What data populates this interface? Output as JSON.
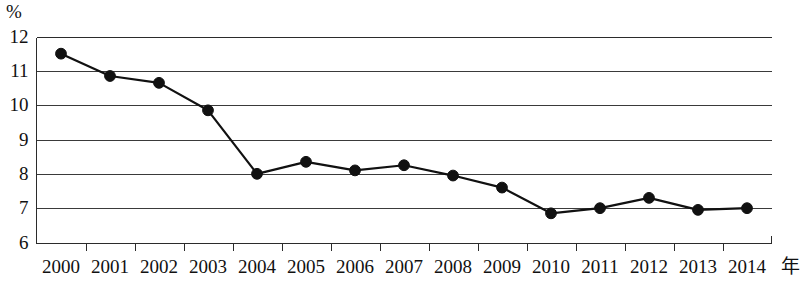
{
  "chart_data": {
    "type": "line",
    "title": "",
    "subtitle": "",
    "xlabel": "年",
    "ylabel": "%",
    "unit_label": "%",
    "categories": [
      "2000",
      "2001",
      "2002",
      "2003",
      "2004",
      "2005",
      "2006",
      "2007",
      "2008",
      "2009",
      "2010",
      "2011",
      "2012",
      "2013",
      "2014"
    ],
    "x": [
      2000,
      2001,
      2002,
      2003,
      2004,
      2005,
      2006,
      2007,
      2008,
      2009,
      2010,
      2011,
      2012,
      2013,
      2014
    ],
    "values": [
      11.5,
      10.85,
      10.65,
      9.85,
      8.0,
      8.35,
      8.1,
      8.25,
      7.95,
      7.6,
      6.85,
      7.0,
      7.3,
      6.95,
      7.0
    ],
    "series": [
      {
        "name": "",
        "values": [
          11.5,
          10.85,
          10.65,
          9.85,
          8.0,
          8.35,
          8.1,
          8.25,
          7.95,
          7.6,
          6.85,
          7.0,
          7.3,
          6.95,
          7.0
        ]
      }
    ],
    "ylim": [
      6,
      12
    ],
    "yticks": [
      "12",
      "11",
      "10",
      "9",
      "8",
      "7",
      "6"
    ],
    "ytick_values": [
      12,
      11,
      10,
      9,
      8,
      7,
      6
    ],
    "xtick_labels": [
      "2000",
      "2001",
      "2002",
      "2003",
      "2004",
      "2005",
      "2006",
      "2007",
      "2008",
      "2009",
      "2010",
      "2011",
      "2012",
      "2013",
      "2014"
    ],
    "grid": true,
    "grid_axis": "y",
    "legend": false,
    "legend_position": "none",
    "marker": "filled-circle",
    "line_color": "#111111",
    "marker_color": "#111111",
    "grid_color": "#3a3a3a",
    "background_color": "#ffffff"
  }
}
